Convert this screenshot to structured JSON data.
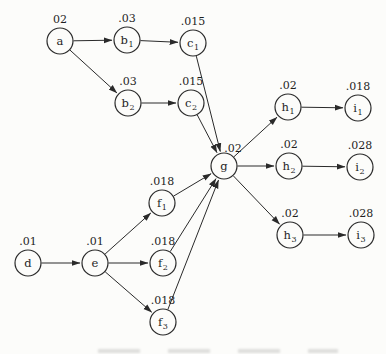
{
  "figure": {
    "colors": {
      "background": "#fcfcfa",
      "ink": "#2a2a2a",
      "text": "#1f1f1f",
      "node_fill": "#fcfcfa"
    },
    "node_radius": 13,
    "value_label_default_offset": {
      "dx": 0,
      "dy": -18
    },
    "nodes": [
      {
        "id": "a",
        "base": "a",
        "sub": "",
        "value": "02",
        "x": 60,
        "y": 41
      },
      {
        "id": "b1",
        "base": "b",
        "sub": "1",
        "value": ".03",
        "x": 127,
        "y": 40
      },
      {
        "id": "b2",
        "base": "b",
        "sub": "2",
        "value": ".03",
        "x": 128,
        "y": 103
      },
      {
        "id": "c1",
        "base": "c",
        "sub": "1",
        "value": ".015",
        "x": 193,
        "y": 43
      },
      {
        "id": "c2",
        "base": "c",
        "sub": "2",
        "value": ".015",
        "x": 191,
        "y": 103
      },
      {
        "id": "d",
        "base": "d",
        "sub": "",
        "value": ".01",
        "x": 28,
        "y": 263
      },
      {
        "id": "e",
        "base": "e",
        "sub": "",
        "value": ".01",
        "x": 95,
        "y": 263
      },
      {
        "id": "f1",
        "base": "f",
        "sub": "1",
        "value": ".018",
        "x": 162,
        "y": 203
      },
      {
        "id": "f2",
        "base": "f",
        "sub": "2",
        "value": ".018",
        "x": 163,
        "y": 263
      },
      {
        "id": "f3",
        "base": "f",
        "sub": "3",
        "value": ".018",
        "x": 163,
        "y": 322
      },
      {
        "id": "g",
        "base": "g",
        "sub": "",
        "value": ".02",
        "x": 224,
        "y": 166,
        "value_dx": 9,
        "value_dy": -14
      },
      {
        "id": "h1",
        "base": "h",
        "sub": "1",
        "value": ".02",
        "x": 288,
        "y": 107
      },
      {
        "id": "h2",
        "base": "h",
        "sub": "2",
        "value": ".02",
        "x": 289,
        "y": 166
      },
      {
        "id": "h3",
        "base": "h",
        "sub": "3",
        "value": ".02",
        "x": 290,
        "y": 235
      },
      {
        "id": "i1",
        "base": "i",
        "sub": "1",
        "value": ".018",
        "x": 358,
        "y": 108
      },
      {
        "id": "i2",
        "base": "i",
        "sub": "2",
        "value": ".028",
        "x": 360,
        "y": 167
      },
      {
        "id": "i3",
        "base": "i",
        "sub": "3",
        "value": ".028",
        "x": 361,
        "y": 235
      }
    ],
    "edges": [
      [
        "a",
        "b1"
      ],
      [
        "a",
        "b2"
      ],
      [
        "b1",
        "c1"
      ],
      [
        "b2",
        "c2"
      ],
      [
        "c1",
        "g"
      ],
      [
        "c2",
        "g"
      ],
      [
        "d",
        "e"
      ],
      [
        "e",
        "f1"
      ],
      [
        "e",
        "f2"
      ],
      [
        "e",
        "f3"
      ],
      [
        "f1",
        "g"
      ],
      [
        "f2",
        "g"
      ],
      [
        "f3",
        "g"
      ],
      [
        "g",
        "h1"
      ],
      [
        "g",
        "h2"
      ],
      [
        "g",
        "h3"
      ],
      [
        "h1",
        "i1"
      ],
      [
        "h2",
        "i2"
      ],
      [
        "h3",
        "i3"
      ]
    ]
  }
}
